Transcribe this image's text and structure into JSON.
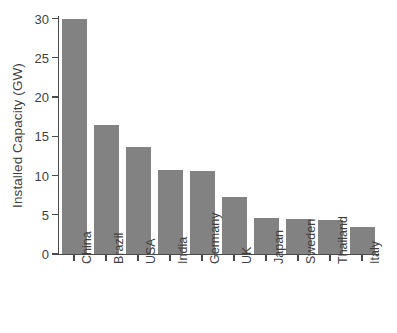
{
  "chart_data": {
    "type": "bar",
    "title": "",
    "xlabel": "",
    "ylabel": "Installed Capacity (GW)",
    "categories": [
      "China",
      "Brazil",
      "USA",
      "India",
      "Germany",
      "UK",
      "Japan",
      "Sweden",
      "Thailand",
      "Italy"
    ],
    "values": [
      30.0,
      16.4,
      13.6,
      10.7,
      10.6,
      7.3,
      4.6,
      4.5,
      4.3,
      3.5
    ],
    "ylim": [
      0,
      30
    ],
    "yticks": [
      0,
      5,
      10,
      15,
      20,
      25,
      30
    ],
    "ytick_labels": [
      "0",
      "5",
      "10",
      "15",
      "20",
      "25",
      "30"
    ],
    "grid": false,
    "legend": null,
    "bar_color": "#828282",
    "axis_color": "#4a4a4a",
    "text_color": "#3f3f3f",
    "background": "#ffffff",
    "xtick_label_rotation": 90
  }
}
